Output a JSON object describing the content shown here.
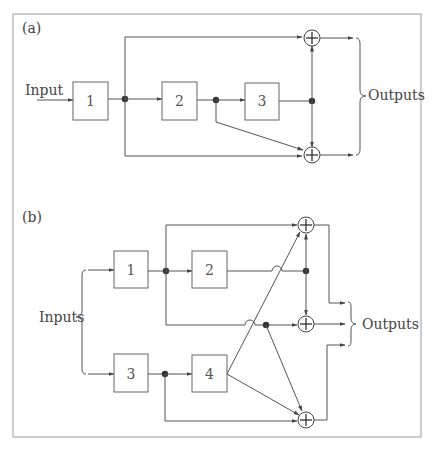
{
  "panel_a": {
    "label": "(a)",
    "input_label": "Input",
    "output_label": "Outputs",
    "blocks": [
      "1",
      "2",
      "3"
    ]
  },
  "panel_b": {
    "label": "(b)",
    "input_label": "Inputs",
    "output_label": "Outputs",
    "blocks": [
      "1",
      "2",
      "3",
      "4"
    ]
  }
}
